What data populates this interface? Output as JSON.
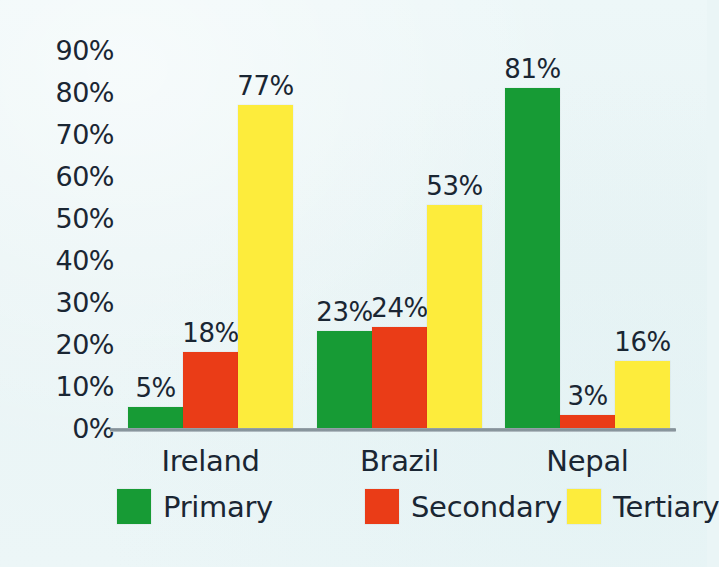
{
  "chart_data": {
    "type": "bar",
    "title": "",
    "subtitle": "",
    "xlabel": "",
    "ylabel": "",
    "categories": [
      "Ireland",
      "Brazil",
      "Nepal"
    ],
    "series": [
      {
        "name": "Primary",
        "color": "#179b35",
        "values": [
          5,
          23,
          81
        ],
        "labels": [
          "5%",
          "23%",
          "81%"
        ]
      },
      {
        "name": "Secondary",
        "color": "#ea3c17",
        "values": [
          18,
          24,
          3
        ],
        "labels": [
          "18%",
          "24%",
          "3%"
        ]
      },
      {
        "name": "Tertiary",
        "color": "#fdec3c",
        "values": [
          77,
          53,
          16
        ],
        "labels": [
          "77%",
          "53%",
          "16%"
        ]
      }
    ],
    "ylim": [
      0,
      90
    ],
    "ytick_values": [
      0,
      10,
      20,
      30,
      40,
      50,
      60,
      70,
      80,
      90
    ],
    "ytick_labels": [
      "0%",
      "10%",
      "20%",
      "30%",
      "40%",
      "50%",
      "60%",
      "70%",
      "80%",
      "90%"
    ],
    "grid": false,
    "value_labels": true,
    "legend_position": "bottom",
    "background_color": "#eaf5f6",
    "axis_line_color": "#8a969e",
    "text_color": "#1a2633"
  },
  "axis": {
    "ticks": [
      {
        "label": "90%",
        "value": 90
      },
      {
        "label": "80%",
        "value": 80
      },
      {
        "label": "70%",
        "value": 70
      },
      {
        "label": "60%",
        "value": 60
      },
      {
        "label": "50%",
        "value": 50
      },
      {
        "label": "40%",
        "value": 40
      },
      {
        "label": "30%",
        "value": 30
      },
      {
        "label": "20%",
        "value": 20
      },
      {
        "label": "10%",
        "value": 10
      },
      {
        "label": "0%",
        "value": 0
      }
    ]
  },
  "legend": {
    "items": [
      {
        "label": "Primary",
        "color": "#179b35"
      },
      {
        "label": "Secondary",
        "color": "#ea3c17"
      },
      {
        "label": "Tertiary",
        "color": "#fdec3c"
      }
    ]
  }
}
